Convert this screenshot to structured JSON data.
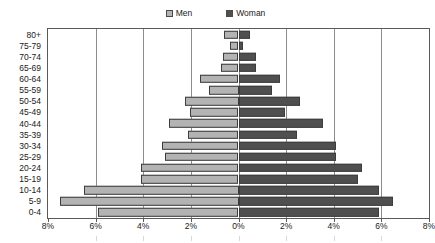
{
  "legend": {
    "position": "top-center",
    "entries": [
      {
        "label": "Men",
        "color": "#b3b3b3",
        "swatch_name": "legend-swatch-men"
      },
      {
        "label": "Woman",
        "color": "#4f4f4f",
        "swatch_name": "legend-swatch-women"
      }
    ]
  },
  "axes": {
    "x_tick_labels": [
      "8%",
      "6%",
      "4%",
      "2%",
      "0%",
      "2%",
      "4%",
      "6%",
      "8%"
    ],
    "x_tick_values": [
      -8,
      -6,
      -4,
      -2,
      0,
      2,
      4,
      6,
      8
    ],
    "y_tick_labels": [
      "80+",
      "75-79",
      "70-74",
      "65-69",
      "60-64",
      "55-59",
      "50-54",
      "45-49",
      "40-44",
      "35-39",
      "30-34",
      "25-29",
      "20-24",
      "15-19",
      "10-14",
      "5-9",
      "0-4"
    ]
  },
  "chart_data": {
    "type": "bar",
    "subtype": "population-pyramid",
    "title": "",
    "subtitle": "",
    "xlabel": "",
    "ylabel": "",
    "xlim": [
      -8,
      8
    ],
    "grid": true,
    "orientation": "horizontal",
    "legend_position": "top-center",
    "categories": [
      "80+",
      "75-79",
      "70-74",
      "65-69",
      "60-64",
      "55-59",
      "50-54",
      "45-49",
      "40-44",
      "35-39",
      "30-34",
      "25-29",
      "20-24",
      "15-19",
      "10-14",
      "5-9",
      "0-4"
    ],
    "series": [
      {
        "name": "Men",
        "color": "#b3b3b3",
        "side": "left",
        "values": [
          0.6,
          0.35,
          0.67,
          0.72,
          1.6,
          1.25,
          2.25,
          2.05,
          2.9,
          2.1,
          3.2,
          3.1,
          4.1,
          4.1,
          6.5,
          7.5,
          5.9
        ]
      },
      {
        "name": "Woman",
        "color": "#4f4f4f",
        "side": "right",
        "values": [
          0.5,
          0.2,
          0.75,
          0.75,
          1.75,
          1.4,
          2.6,
          1.95,
          3.55,
          2.45,
          4.1,
          4.1,
          5.2,
          5.0,
          5.9,
          6.5,
          5.9
        ]
      }
    ]
  }
}
